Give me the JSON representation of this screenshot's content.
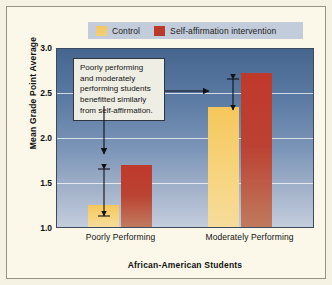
{
  "chart_data": {
    "type": "bar",
    "title": "",
    "xlabel": "African-American Students",
    "ylabel": "Mean Grade Point Average",
    "categories": [
      "Poorly Performing",
      "Moderately Performing"
    ],
    "series": [
      {
        "name": "Control",
        "color": "#f6c75b",
        "values": [
          1.25,
          2.35
        ]
      },
      {
        "name": "Self-affirmation intervention",
        "color": "#c0392b",
        "values": [
          1.7,
          2.73
        ]
      }
    ],
    "ylim": [
      1.0,
      3.0
    ],
    "yticks": [
      "3.0",
      "2.5",
      "2.0",
      "1.5",
      "1.0"
    ],
    "ytick_values": [
      3.0,
      2.5,
      2.0,
      1.5,
      1.0
    ],
    "grid": true,
    "legend_position": "top",
    "annotations": [
      {
        "text": "Poorly performing and moderately performing students benefitted similarly from self-affirmation.",
        "lines": [
          "Poorly performing",
          "and moderately",
          "performing students",
          "benefitted similarly",
          "from self-affirmation."
        ]
      }
    ]
  },
  "legend": {
    "items": [
      {
        "label": "Control",
        "color": "#f6c75b"
      },
      {
        "label": "Self-affirmation intervention",
        "color": "#c0392b"
      }
    ]
  },
  "axes": {
    "y_title": "Mean Grade Point Average",
    "x_title": "African-American Students",
    "y_ticks": [
      "3.0",
      "2.5",
      "2.0",
      "1.5",
      "1.0"
    ],
    "x_categories": [
      "Poorly Performing",
      "Moderately Performing"
    ]
  },
  "callout": {
    "line1": "Poorly performing",
    "line2": "and moderately",
    "line3": "performing students",
    "line4": "benefitted similarly",
    "line5": "from self-affirmation."
  }
}
